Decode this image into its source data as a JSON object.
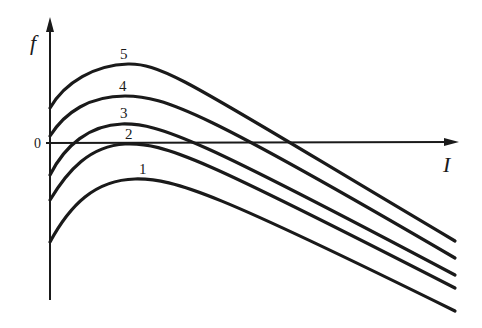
{
  "chart_data": {
    "type": "line",
    "title": "",
    "xlabel": "I",
    "ylabel": "f",
    "origin_label": "0",
    "grid": false,
    "series": [
      {
        "name": "1",
        "path": "M50,242 C70,205 95,180 135,179 C175,178 220,195 455,311",
        "label_pos": [
          139,
          174
        ]
      },
      {
        "name": "2",
        "path": "M50,200 C68,170 90,146 125,144 C165,142 205,160 455,288",
        "label_pos": [
          125,
          139
        ]
      },
      {
        "name": "3",
        "path": "M50,175 C65,145 90,125 122,124 C160,123 200,140 455,275",
        "label_pos": [
          120,
          118
        ]
      },
      {
        "name": "4",
        "path": "M50,136 C65,112 90,96 125,96 C165,96 205,112 455,258",
        "label_pos": [
          119,
          91
        ]
      },
      {
        "name": "5",
        "path": "M50,108 C65,82 95,65 128,64 C165,63 200,90 455,241",
        "label_pos": [
          120,
          59
        ]
      }
    ],
    "stroke_color": "#1a1a1a"
  }
}
